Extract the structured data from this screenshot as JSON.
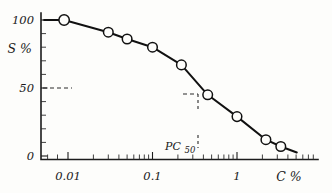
{
  "figure": {
    "kind": "scientific-plot",
    "background_color": "#fdfdfb",
    "ink_color": "#111111"
  },
  "axes": {
    "y_title": "S %",
    "x_title": "C %",
    "y_ticks": [
      "100",
      "50",
      "0"
    ],
    "x_ticks": [
      "0.01",
      "0.1",
      "1"
    ],
    "y_range": [
      0,
      110
    ],
    "x_range_log": [
      -2.45,
      0.63
    ]
  },
  "annotations": {
    "pc50_label": "PC",
    "pc50_subscript": "50",
    "pc50_x_value": 0.42,
    "pc50_y_value": 50,
    "guide_y_value": 50
  },
  "chart_data": {
    "type": "line",
    "title": "",
    "subtitle": "",
    "xlabel": "C %",
    "ylabel": "S %",
    "xscale": "log",
    "yscale": "linear",
    "xlim": [
      0.0035,
      4.3
    ],
    "ylim": [
      0,
      110
    ],
    "grid": false,
    "legend": "none",
    "markers": "open-circle",
    "series": [
      {
        "name": "survival",
        "x": [
          0.009,
          0.03,
          0.05,
          0.1,
          0.22,
          0.45,
          1.0,
          2.2,
          3.3
        ],
        "values": [
          100,
          91,
          86,
          80,
          67,
          45,
          29,
          12,
          7
        ]
      }
    ],
    "annotations": [
      {
        "text": "PC50",
        "x": 0.42,
        "y": 50,
        "note": "concentration producing 50% effect; dashed guide lines meet the curve here"
      }
    ],
    "tick_labels": {
      "x": [
        "0.01",
        "0.1",
        "1"
      ],
      "y": [
        "0",
        "50",
        "100"
      ]
    }
  }
}
